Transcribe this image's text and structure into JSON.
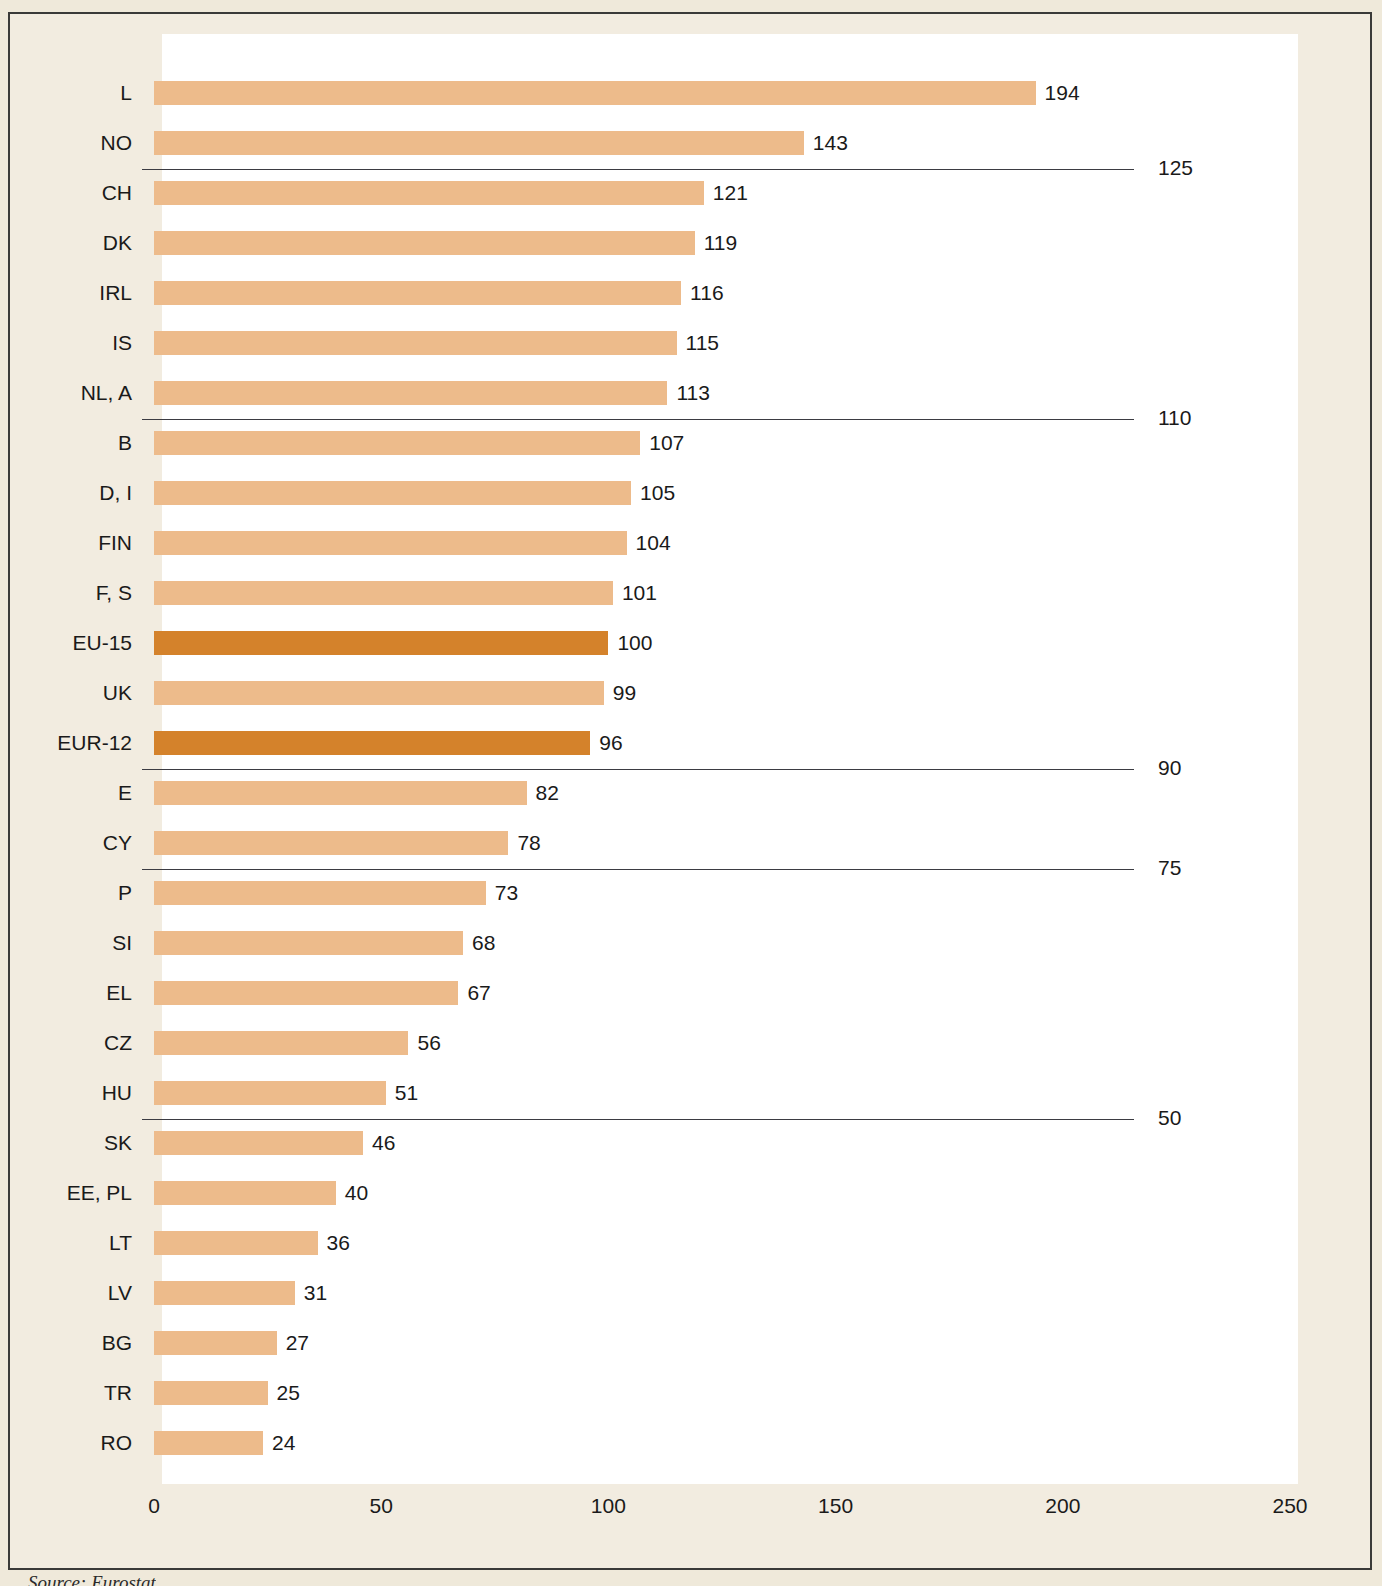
{
  "source_note": "Source: Eurostat",
  "colors": {
    "bar_light": "#edbb8b",
    "bar_dark": "#d4822b",
    "background": "#f2ece0",
    "plot_background": "#ffffff",
    "border": "#3a3a38",
    "text": "#1a1a1a"
  },
  "chart_data": {
    "type": "bar",
    "orientation": "horizontal",
    "title": "",
    "xlabel": "",
    "ylabel": "",
    "xlim": [
      0,
      250
    ],
    "xticks": [
      0,
      50,
      100,
      150,
      200,
      250
    ],
    "xtick_labels": [
      "0",
      "50",
      "100",
      "150",
      "200",
      "250"
    ],
    "grid": false,
    "legend": null,
    "categories": [
      "L",
      "NO",
      "CH",
      "DK",
      "IRL",
      "IS",
      "NL, A",
      "B",
      "D, I",
      "FIN",
      "F, S",
      "EU-15",
      "UK",
      "EUR-12",
      "E",
      "CY",
      "P",
      "SI",
      "EL",
      "CZ",
      "HU",
      "SK",
      "EE, PL",
      "LT",
      "LV",
      "BG",
      "TR",
      "RO"
    ],
    "values": [
      194,
      143,
      121,
      119,
      116,
      115,
      113,
      107,
      105,
      104,
      101,
      100,
      99,
      96,
      82,
      78,
      73,
      68,
      67,
      56,
      51,
      46,
      40,
      36,
      31,
      27,
      25,
      24
    ],
    "highlighted": [
      "EU-15",
      "EUR-12"
    ],
    "bars": [
      {
        "label": "L",
        "value": 194,
        "value_text": "194",
        "highlight": false
      },
      {
        "label": "NO",
        "value": 143,
        "value_text": "143",
        "highlight": false
      },
      {
        "label": "CH",
        "value": 121,
        "value_text": "121",
        "highlight": false
      },
      {
        "label": "DK",
        "value": 119,
        "value_text": "119",
        "highlight": false
      },
      {
        "label": "IRL",
        "value": 116,
        "value_text": "116",
        "highlight": false
      },
      {
        "label": "IS",
        "value": 115,
        "value_text": "115",
        "highlight": false
      },
      {
        "label": "NL, A",
        "value": 113,
        "value_text": "113",
        "highlight": false
      },
      {
        "label": "B",
        "value": 107,
        "value_text": "107",
        "highlight": false
      },
      {
        "label": "D, I",
        "value": 105,
        "value_text": "105",
        "highlight": false
      },
      {
        "label": "FIN",
        "value": 104,
        "value_text": "104",
        "highlight": false
      },
      {
        "label": "F, S",
        "value": 101,
        "value_text": "101",
        "highlight": false
      },
      {
        "label": "EU-15",
        "value": 100,
        "value_text": "100",
        "highlight": true
      },
      {
        "label": "UK",
        "value": 99,
        "value_text": "99",
        "highlight": false
      },
      {
        "label": "EUR-12",
        "value": 96,
        "value_text": "96",
        "highlight": true
      },
      {
        "label": "E",
        "value": 82,
        "value_text": "82",
        "highlight": false
      },
      {
        "label": "CY",
        "value": 78,
        "value_text": "78",
        "highlight": false
      },
      {
        "label": "P",
        "value": 73,
        "value_text": "73",
        "highlight": false
      },
      {
        "label": "SI",
        "value": 68,
        "value_text": "68",
        "highlight": false
      },
      {
        "label": "EL",
        "value": 67,
        "value_text": "67",
        "highlight": false
      },
      {
        "label": "CZ",
        "value": 56,
        "value_text": "56",
        "highlight": false
      },
      {
        "label": "HU",
        "value": 51,
        "value_text": "51",
        "highlight": false
      },
      {
        "label": "SK",
        "value": 46,
        "value_text": "46",
        "highlight": false
      },
      {
        "label": "EE, PL",
        "value": 40,
        "value_text": "40",
        "highlight": false
      },
      {
        "label": "LT",
        "value": 36,
        "value_text": "36",
        "highlight": false
      },
      {
        "label": "LV",
        "value": 31,
        "value_text": "31",
        "highlight": false
      },
      {
        "label": "BG",
        "value": 27,
        "value_text": "27",
        "highlight": false
      },
      {
        "label": "TR",
        "value": 25,
        "value_text": "25",
        "highlight": false
      },
      {
        "label": "RO",
        "value": 24,
        "value_text": "24",
        "highlight": false
      }
    ],
    "reference_lines": [
      {
        "value": 125,
        "label": "125",
        "after_category": "NO"
      },
      {
        "value": 110,
        "label": "110",
        "after_category": "NL, A"
      },
      {
        "value": 90,
        "label": "90",
        "after_category": "EUR-12"
      },
      {
        "value": 75,
        "label": "75",
        "after_category": "CY"
      },
      {
        "value": 50,
        "label": "50",
        "after_category": "HU"
      }
    ]
  }
}
